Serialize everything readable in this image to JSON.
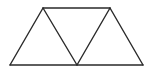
{
  "diagram": {
    "stroke_color": "#2a2a2a",
    "background": "#ffffff",
    "vertices": {
      "A": [
        43,
        8
      ],
      "B": [
        110,
        8
      ],
      "C": [
        10,
        65
      ],
      "D": [
        77,
        65
      ],
      "E": [
        143,
        65
      ]
    },
    "edges": [
      [
        "A",
        "B"
      ],
      [
        "C",
        "E"
      ],
      [
        "C",
        "A"
      ],
      [
        "A",
        "D"
      ],
      [
        "D",
        "B"
      ],
      [
        "B",
        "E"
      ]
    ]
  }
}
